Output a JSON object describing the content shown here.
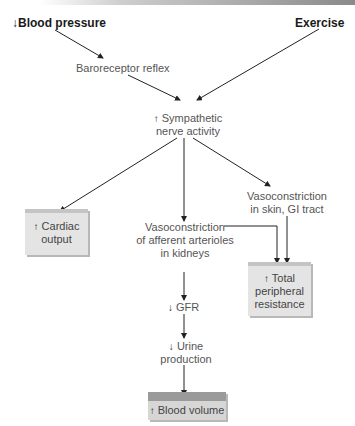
{
  "diagram": {
    "inputs": {
      "blood_pressure": {
        "prefix": "↓",
        "label": "Blood pressure"
      },
      "exercise": {
        "label": "Exercise"
      }
    },
    "nodes": {
      "baroreceptor": {
        "label": "Baroreceptor reflex"
      },
      "sympathetic": {
        "prefix": "↑",
        "line1": "Sympathetic",
        "line2": "nerve activity"
      },
      "cardiac_output": {
        "prefix": "↑",
        "line1": "Cardiac",
        "line2": "output"
      },
      "vaso_kidney": {
        "line1": "Vasoconstriction",
        "line2": "of afferent arterioles",
        "line3": "in kidneys"
      },
      "vaso_skin": {
        "line1": "Vasoconstriction",
        "line2": "in skin, GI tract"
      },
      "tpr": {
        "prefix": "↑",
        "line1": "Total",
        "line2": "peripheral",
        "line3": "resistance"
      },
      "gfr": {
        "prefix": "↓",
        "label": "GFR"
      },
      "urine": {
        "prefix": "↓",
        "line1": "Urine",
        "line2": "production"
      },
      "blood_volume": {
        "prefix": "↑",
        "label": "Blood volume"
      }
    },
    "colors": {
      "box_fill": "#e4e4e4",
      "box_top": "#c4c4c4",
      "blood_volume_top": "#9a9a9a",
      "arrow": "#222222"
    }
  }
}
